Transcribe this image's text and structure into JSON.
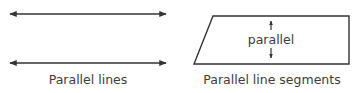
{
  "diagram": {
    "left_panel": {
      "caption": "Parallel lines",
      "lines": [
        {
          "y": 14,
          "x1": 10,
          "x2": 166,
          "arrows": "both"
        },
        {
          "y": 63,
          "x1": 10,
          "x2": 166,
          "arrows": "both"
        }
      ]
    },
    "right_panel": {
      "caption": "Parallel line segments",
      "shape": "parallelogram",
      "vertices": [
        [
          213,
          16
        ],
        [
          349,
          16
        ],
        [
          349,
          64
        ],
        [
          194,
          64
        ]
      ],
      "inner_label": "parallel",
      "arrows": [
        "up",
        "down"
      ]
    },
    "colors": {
      "stroke": "#333333",
      "text": "#3d3d3d",
      "background": "#ffffff"
    }
  }
}
